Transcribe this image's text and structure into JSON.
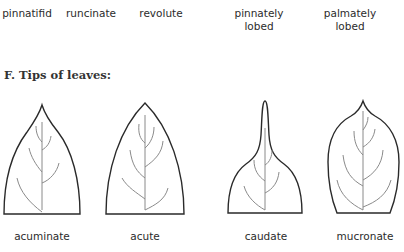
{
  "top_row_labels": [
    {
      "text": "pinnatifid",
      "x": 2,
      "y": 7,
      "w": 50
    },
    {
      "text": "runcinate",
      "x": 66,
      "y": 7,
      "w": 50
    },
    {
      "text": "revolute",
      "x": 136,
      "y": 7,
      "w": 50
    },
    {
      "text": "pinnately",
      "text2": "lobed",
      "x": 229,
      "y": 7,
      "w": 60
    },
    {
      "text": "palmately",
      "text2": "lobed",
      "x": 320,
      "y": 7,
      "w": 60
    }
  ],
  "section_title": "F. Tips of leaves:",
  "leaves": [
    {
      "name": "acuminate",
      "label_x": 12,
      "label_w": 60
    },
    {
      "name": "acute",
      "label_x": 117,
      "label_w": 56
    },
    {
      "name": "caudate",
      "label_x": 238,
      "label_w": 56
    },
    {
      "name": "mucronate",
      "label_x": 333,
      "label_w": 64
    }
  ]
}
